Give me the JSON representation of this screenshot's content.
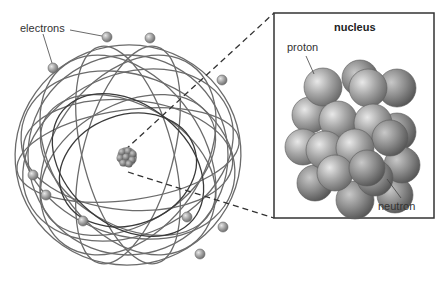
{
  "diagram": {
    "type": "atom-structure",
    "labels": {
      "electrons": "electrons",
      "nucleus_title": "nucleus",
      "proton": "proton",
      "neutron": "neutron"
    },
    "colors": {
      "orbit": "#6b6b6b",
      "orbit_dark": "#3a3a3a",
      "particle": "#9a9a9a",
      "box_border": "#333333",
      "dashed_line": "#333333"
    },
    "electrons": [
      {
        "x": 107,
        "y": 37
      },
      {
        "x": 150,
        "y": 38
      },
      {
        "x": 53,
        "y": 68
      },
      {
        "x": 222,
        "y": 80
      },
      {
        "x": 33,
        "y": 175
      },
      {
        "x": 46,
        "y": 195
      },
      {
        "x": 83,
        "y": 221
      },
      {
        "x": 187,
        "y": 217
      },
      {
        "x": 223,
        "y": 227
      },
      {
        "x": 200,
        "y": 254
      }
    ]
  }
}
